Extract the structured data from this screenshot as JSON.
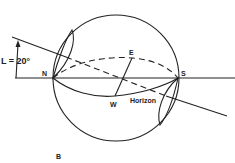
{
  "figure": {
    "panel_label": "B",
    "angle_label": "L = 20°",
    "labels": {
      "north": "N",
      "south": "S",
      "east": "E",
      "west": "W",
      "horizon": "Horizon"
    }
  },
  "colors": {
    "ink": "#222222",
    "background": "#ffffff"
  }
}
